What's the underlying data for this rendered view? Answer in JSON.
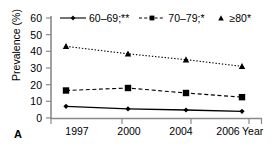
{
  "panel": {
    "label": "A"
  },
  "axes": {
    "ylabel": "Prevalence (%)",
    "xlabel": "Year",
    "yticks": [
      "0",
      "10",
      "20",
      "30",
      "40",
      "50",
      "60"
    ],
    "xticks": [
      "1997",
      "2000",
      "2004",
      "2006"
    ]
  },
  "legend": [
    {
      "label": "60–69;**",
      "marker": "diamond-marker",
      "line": "solid"
    },
    {
      "label": "70–79;*",
      "marker": "square-marker",
      "line": "dashed"
    },
    {
      "label": "≥80*",
      "marker": "triangle-marker",
      "line": "dotted"
    }
  ],
  "chart_data": {
    "type": "line",
    "title": "",
    "xlabel": "Year",
    "ylabel": "Prevalence (%)",
    "categories": [
      "1997",
      "2000",
      "2004",
      "2006"
    ],
    "x": [
      1997,
      2000,
      2004,
      2006
    ],
    "ylim": [
      0,
      60
    ],
    "yticks": [
      0,
      10,
      20,
      30,
      40,
      50,
      60
    ],
    "grid": false,
    "legend_position": "top",
    "series": [
      {
        "name": "60–69;**",
        "values": [
          7.0,
          5.5,
          4.8,
          4.0
        ],
        "marker": "diamond",
        "linestyle": "solid",
        "color": "#000000"
      },
      {
        "name": "70–79;*",
        "values": [
          16.5,
          18.0,
          15.0,
          12.5
        ],
        "marker": "square",
        "linestyle": "dashed",
        "color": "#000000"
      },
      {
        "name": "≥80*",
        "values": [
          43.0,
          38.5,
          35.0,
          31.0
        ],
        "marker": "triangle",
        "linestyle": "dotted",
        "color": "#000000"
      }
    ]
  }
}
